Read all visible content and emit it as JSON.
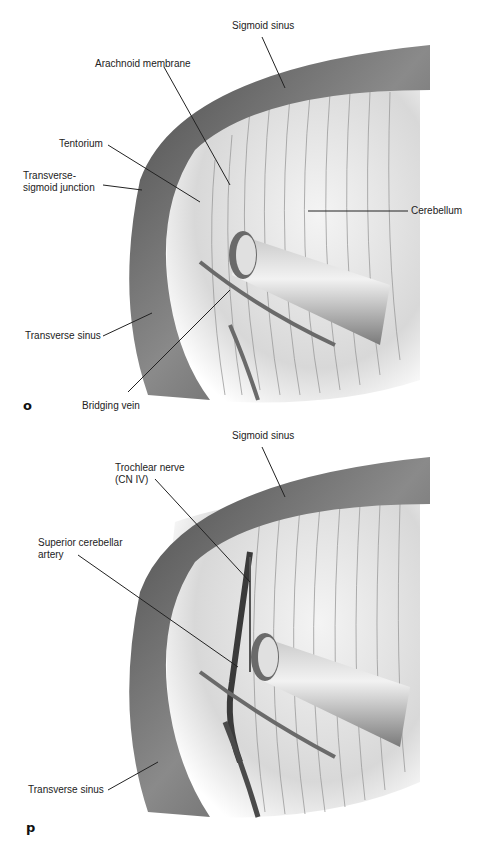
{
  "panels": [
    {
      "id": "o",
      "letter": "o",
      "labels": {
        "sigmoid_sinus": "Sigmoid sinus",
        "arachnoid_membrane": "Arachnoid membrane",
        "tentorium": "Tentorium",
        "transverse_sigmoid_junction": "Transverse-\nsigmoid junction",
        "cerebellum": "Cerebellum",
        "transverse_sinus": "Transverse sinus",
        "bridging_vein": "Bridging vein"
      }
    },
    {
      "id": "p",
      "letter": "p",
      "labels": {
        "sigmoid_sinus": "Sigmoid sinus",
        "trochlear_nerve": "Trochlear nerve\n(CN IV)",
        "superior_cerebellar_artery": "Superior cerebellar\nartery",
        "transverse_sinus": "Transverse sinus"
      }
    }
  ],
  "colors": {
    "sinus_dark": "#5a5a5a",
    "sinus_light": "#9a9a9a",
    "tissue": "#e6e6e6",
    "line": "#222222"
  }
}
